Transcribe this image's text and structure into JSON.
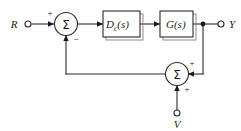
{
  "diagram": {
    "type": "control-block-diagram",
    "background_color": "#ffffff",
    "line_color": "#2b2b2b",
    "text_color": "#1a1a1a",
    "inputs": [
      {
        "id": "R",
        "label": "R",
        "role": "reference-input"
      },
      {
        "id": "V",
        "label": "V",
        "role": "sensor-noise-input"
      }
    ],
    "outputs": [
      {
        "id": "Y",
        "label": "Y",
        "role": "plant-output"
      }
    ],
    "blocks": [
      {
        "id": "compensator",
        "label_main": "D",
        "label_sub": "c",
        "label_arg": "(s)",
        "label_full": "Dc(s)",
        "role": "compensator"
      },
      {
        "id": "plant",
        "label_main": "G",
        "label_sub": "",
        "label_arg": "(s)",
        "label_full": "G(s)",
        "role": "plant"
      }
    ],
    "summing_junctions": [
      {
        "id": "error-summer",
        "glyph": "Σ",
        "signs": [
          {
            "input": "reference",
            "sign": "+"
          },
          {
            "input": "feedback",
            "sign": "−"
          }
        ]
      },
      {
        "id": "noise-summer",
        "glyph": "Σ",
        "signs": [
          {
            "input": "output",
            "sign": "+"
          },
          {
            "input": "noise",
            "sign": "+"
          }
        ]
      }
    ],
    "signs": {
      "plus": "+",
      "minus": "−"
    }
  }
}
